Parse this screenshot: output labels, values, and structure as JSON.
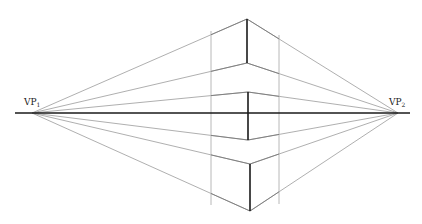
{
  "diagram": {
    "width": 422,
    "height": 224,
    "colors": {
      "background": "#ffffff",
      "horizon": "#1a1a1a",
      "front_edge": "#1a1a1a",
      "construction": "#9a9a9a",
      "side_vertical": "#b0b0b0"
    },
    "horizon": {
      "y": 113,
      "x1": 15,
      "x2": 410
    },
    "vanishing_points": [
      {
        "id": "vp1",
        "label": "VP",
        "subscript": "1",
        "x": 32,
        "y": 113,
        "label_x": 24,
        "label_y": 98
      },
      {
        "id": "vp2",
        "label": "VP",
        "subscript": "2",
        "x": 398,
        "y": 113,
        "label_x": 389,
        "label_y": 98
      }
    ],
    "side_verticals": {
      "left_x": 211,
      "right_x": 279
    },
    "boxes": [
      {
        "name": "top-box",
        "front_x": 247,
        "top_y": 19,
        "bottom_y": 63
      },
      {
        "name": "middle-box",
        "front_x": 248,
        "top_y": 92,
        "bottom_y": 140
      },
      {
        "name": "bottom-box",
        "front_x": 250,
        "top_y": 164,
        "bottom_y": 211
      }
    ]
  }
}
